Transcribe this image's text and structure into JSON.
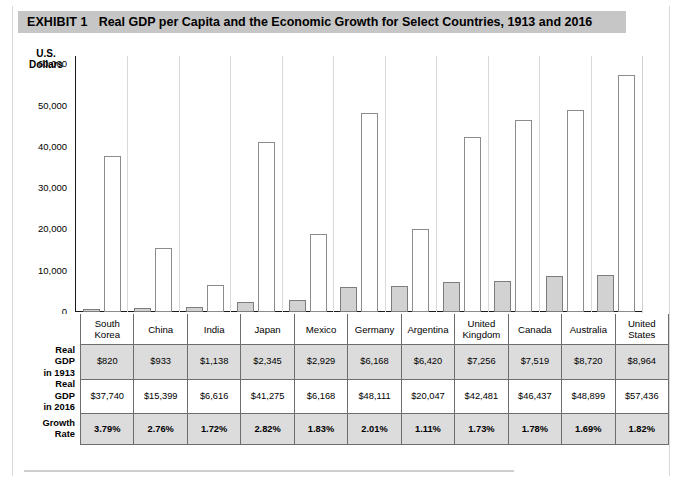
{
  "exhibit": {
    "label": "EXHIBIT 1",
    "title": "Real GDP per Capita and the Economic Growth for Select Countries, 1913 and 2016"
  },
  "chart_data": {
    "type": "bar",
    "title": "Real GDP per Capita and the Economic Growth for Select Countries, 1913 and 2016",
    "xlabel": "",
    "ylabel": "U.S. Dollars",
    "ylim": [
      0,
      62000
    ],
    "yticks": [
      0,
      10000,
      20000,
      30000,
      40000,
      50000,
      60000
    ],
    "ytick_labels": [
      "0",
      "10,000",
      "20,000",
      "30,000",
      "40,000",
      "50,000",
      "60,000"
    ],
    "grid": false,
    "legend": "none",
    "categories": [
      "South Korea",
      "China",
      "India",
      "Japan",
      "Mexico",
      "Germany",
      "Argentina",
      "United Kingdom",
      "Canada",
      "Australia",
      "United States"
    ],
    "series": [
      {
        "name": "Real GDP in 1913",
        "values": [
          820,
          933,
          1138,
          2345,
          2929,
          6168,
          6420,
          7256,
          7519,
          8720,
          8964
        ]
      },
      {
        "name": "Real GDP in 2016",
        "values": [
          37740,
          15399,
          6616,
          41275,
          18800,
          48111,
          20047,
          42481,
          46437,
          48899,
          57436
        ]
      }
    ]
  },
  "axis": {
    "y_title_line1": "U.S.",
    "y_title_line2": "Dollars",
    "ticks": [
      "60,000",
      "50,000",
      "40,000",
      "30,000",
      "20,000",
      "10,000",
      "0"
    ]
  },
  "table": {
    "row_labels": {
      "countries": "",
      "gdp1913": "Real\nGDP\nin 1913",
      "gdp2016": "Real\nGDP\nin 2016",
      "growth": "Growth\nRate"
    },
    "row_label_lines": {
      "gdp1913": [
        "Real",
        "GDP",
        "in 1913"
      ],
      "gdp2016": [
        "Real",
        "GDP",
        "in 2016"
      ],
      "growth": [
        "Growth",
        "Rate"
      ]
    },
    "countries": [
      [
        "South",
        "Korea"
      ],
      [
        "China"
      ],
      [
        "India"
      ],
      [
        "Japan"
      ],
      [
        "Mexico"
      ],
      [
        "Germany"
      ],
      [
        "Argentina"
      ],
      [
        "United",
        "Kingdom"
      ],
      [
        "Canada"
      ],
      [
        "Australia"
      ],
      [
        "United",
        "States"
      ]
    ],
    "gdp1913": [
      "$820",
      "$933",
      "$1,138",
      "$2,345",
      "$2,929",
      "$6,168",
      "$6,420",
      "$7,256",
      "$7,519",
      "$8,720",
      "$8,964"
    ],
    "gdp2016": [
      "$37,740",
      "$15,399",
      "$6,616",
      "$41,275",
      "$6,168",
      "$48,111",
      "$20,047",
      "$42,481",
      "$46,437",
      "$48,899",
      "$57,436"
    ],
    "growth": [
      "3.79%",
      "2.76%",
      "1.72%",
      "2.82%",
      "1.83%",
      "2.01%",
      "1.11%",
      "1.73%",
      "1.78%",
      "1.69%",
      "1.82%"
    ]
  },
  "colors": {
    "title_bar": "#c6c6c6",
    "bar_1913_fill": "#d2d2d2",
    "bar_2016_fill": "#ffffff",
    "bar_stroke": "#7d7d7d",
    "shaded_row": "#dcdcdc"
  }
}
